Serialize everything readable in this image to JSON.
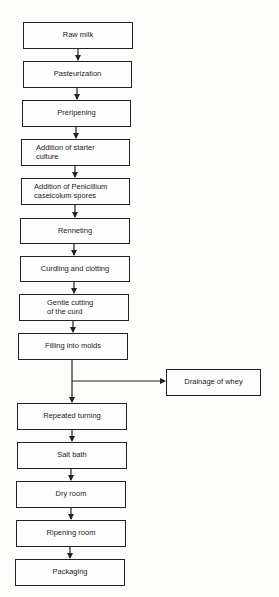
{
  "flowchart": {
    "steps": [
      {
        "id": "raw-milk",
        "label": "Raw milk"
      },
      {
        "id": "pasteurization",
        "label": "Pasteurization"
      },
      {
        "id": "preripening",
        "label": "Preripening"
      },
      {
        "id": "starter-culture",
        "label": "Addition of starter culture",
        "line1": "Addition of starter",
        "line2": "culture"
      },
      {
        "id": "penicillium",
        "label": "Addition of Penicillium caseicolum spores",
        "line1": "Addition of Penicillium",
        "line2": "caseicolum spores"
      },
      {
        "id": "renneting",
        "label": "Renneting"
      },
      {
        "id": "curdling",
        "label": "Curdling and clotting"
      },
      {
        "id": "gentle-cutting",
        "label": "Gentle cutting of the curd",
        "line1": "Gentle cutting",
        "line2": "of the curd"
      },
      {
        "id": "filling",
        "label": "Filling into molds"
      },
      {
        "id": "repeated-turning",
        "label": "Repeated turning"
      },
      {
        "id": "salt-bath",
        "label": "Salt bath"
      },
      {
        "id": "dry-room",
        "label": "Dry room"
      },
      {
        "id": "ripening-room",
        "label": "Ripening room"
      },
      {
        "id": "packaging",
        "label": "Packaging"
      }
    ],
    "branch": {
      "id": "drainage",
      "label": "Drainage of whey",
      "from": "filling"
    }
  }
}
